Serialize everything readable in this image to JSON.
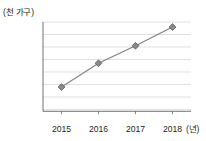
{
  "chart_data": {
    "type": "line",
    "title": "",
    "xlabel": "(년)",
    "ylabel": "(천 가구)",
    "categories": [
      "2015",
      "2016",
      "2017",
      "2018"
    ],
    "values": [
      4440,
      4535,
      4605,
      4680
    ],
    "series": [
      {
        "name": "가구 수",
        "values": [
          4440,
          4535,
          4605,
          4680
        ]
      }
    ],
    "ylim": [
      4300,
      4700
    ],
    "ytick_labels": [
      "4,700",
      "4,650",
      "4,600",
      "4,550",
      "4,500",
      "4,450",
      "4,400",
      "4,350",
      "4,300"
    ],
    "ytick_values": [
      4700,
      4650,
      4600,
      4550,
      4500,
      4450,
      4400,
      4350,
      4300
    ],
    "grid": true,
    "legend": false,
    "legend_position": "none",
    "marker": "diamond",
    "colors": {
      "line": "#808083",
      "marker_fill": "#8a8a8d",
      "marker_edge": "#4d4d4f",
      "gridline": "#d2d2d4",
      "axis": "#58595b",
      "text": "#231f20",
      "background": "#ffffff"
    }
  }
}
